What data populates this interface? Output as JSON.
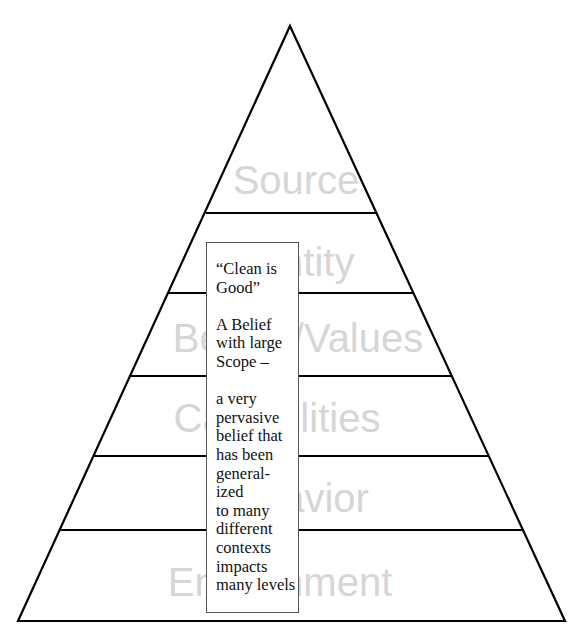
{
  "diagram": {
    "type": "pyramid",
    "line_color": "#000000",
    "label_color": "#d6d6d6",
    "levels": [
      {
        "label": "Source",
        "position": "top"
      },
      {
        "label": "Identity",
        "visible_text": "tity"
      },
      {
        "label": "Beliefs/Values",
        "visible_text": "B / Values"
      },
      {
        "label": "Capabilities",
        "visible_text": "C bilities"
      },
      {
        "label": "Behavior",
        "visible_text": "vior"
      },
      {
        "label": "Environment",
        "visible_text": "En nment",
        "position": "bottom"
      }
    ],
    "callout": {
      "title": "“Clean is\nGood”",
      "subtitle": "A Belief\nwith large\nScope –",
      "body": "a very\npervasive\nbelief that\nhas been\ngeneral-\nized\nto many\ndifferent\ncontexts\nimpacts\nmany levels"
    }
  }
}
